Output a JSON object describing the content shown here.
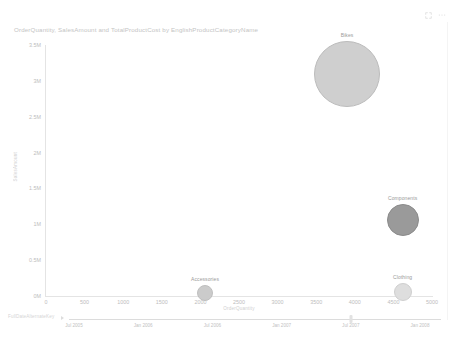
{
  "window": {
    "controls": [
      {
        "name": "focus-mode-icon",
        "glyph": "⤢"
      },
      {
        "name": "more-options-icon",
        "glyph": "⋯"
      }
    ]
  },
  "chart_data": {
    "type": "scatter",
    "title": "OrderQuantity, SalesAmount and TotalProductCost by EnglishProductCategoryName",
    "xlabel": "OrderQuantity",
    "ylabel": "SalesAmount",
    "xlim": [
      0,
      5000
    ],
    "ylim": [
      0,
      3500000
    ],
    "grid": false,
    "legend": "none",
    "size_measure": "TotalProductCost",
    "xticks": [
      "0",
      "500",
      "1000",
      "1500",
      "2000",
      "2500",
      "3000",
      "3500",
      "4000",
      "4500",
      "5000"
    ],
    "xtick_values": [
      0,
      500,
      1000,
      1500,
      2000,
      2500,
      3000,
      3500,
      4000,
      4500,
      5000
    ],
    "yticks": [
      "0M",
      "0.5M",
      "1M",
      "1.5M",
      "2M",
      "2.5M",
      "3M",
      "3.5M"
    ],
    "ytick_values": [
      0,
      500000,
      1000000,
      1500000,
      2000000,
      2500000,
      3000000,
      3500000
    ],
    "points": [
      {
        "label": "Bikes",
        "x": 3900,
        "y": 3100000,
        "size": 2200000,
        "radius_px": 33,
        "color": "#cfcfcf",
        "border": "#bcbcbc"
      },
      {
        "label": "Components",
        "x": 4620,
        "y": 1060000,
        "size": 760000,
        "radius_px": 16,
        "color": "#9a9a9a",
        "border": "#8b8b8b"
      },
      {
        "label": "Accessories",
        "x": 2060,
        "y": 45000,
        "size": 120000,
        "radius_px": 8,
        "color": "#cbcbcb",
        "border": "#bfbfbf"
      },
      {
        "label": "Clothing",
        "x": 4620,
        "y": 55000,
        "size": 150000,
        "radius_px": 9,
        "color": "#dedede",
        "border": "#cfcfcf"
      }
    ]
  },
  "timeline_slider": {
    "field_label": "FullDateAlternateKey",
    "handle_value": "Jul 2007",
    "ticks": [
      "Jul 2005",
      "Jan 2006",
      "Jul 2006",
      "Jan 2007",
      "Jul 2007",
      "Jan 2008"
    ]
  }
}
